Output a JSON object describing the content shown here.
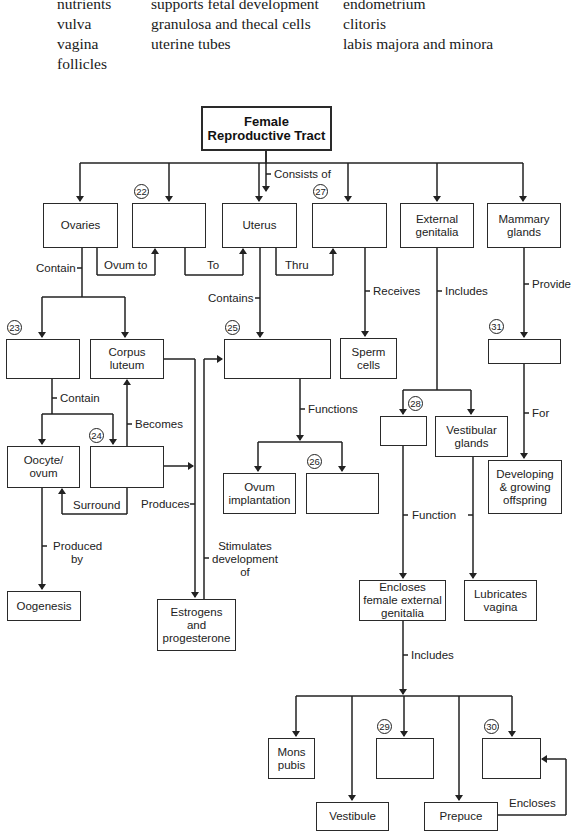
{
  "word_bank": {
    "columns": [
      [
        "nutrients",
        "vulva",
        "vagina",
        "follicles"
      ],
      [
        "supports fetal development",
        "granulosa and thecal cells",
        "uterine tubes"
      ],
      [
        "endometrium",
        "clitoris",
        "labis majora and minora"
      ]
    ]
  },
  "title": "Female Reproductive Tract",
  "boxes": {
    "ovaries": "Ovaries",
    "blank22": "",
    "uterus": "Uterus",
    "blank27": "",
    "external_genitalia": "External genitalia",
    "mammary_glands": "Mammary glands",
    "blank23": "",
    "corpus_luteum": "Corpus luteum",
    "blank25": "",
    "sperm_cells": "Sperm cells",
    "blank31": "",
    "blank28": "",
    "vestibular_glands": "Vestibular glands",
    "oocyte_ovum": "Oocyte/ ovum",
    "blank24": "",
    "ovum_implantation": "Ovum implantation",
    "blank26": "",
    "developing_offspring": "Developing & growing offspring",
    "oogenesis": "Oogenesis",
    "estrogens_progesterone": "Estrogens and progesterone",
    "encloses_female": "Encloses female external genitalia",
    "lubricates_vagina": "Lubricates vagina",
    "mons_pubis": "Mons pubis",
    "blank29": "",
    "blank30": "",
    "vestibule": "Vestibule",
    "prepuce": "Prepuce"
  },
  "numbers": {
    "n22": "22",
    "n23": "23",
    "n24": "24",
    "n25": "25",
    "n26": "26",
    "n27": "27",
    "n28": "28",
    "n29": "29",
    "n30": "30",
    "n31": "31"
  },
  "links": {
    "consists_of": "Consists of",
    "ovum_to": "Ovum to",
    "to": "To",
    "thru": "Thru",
    "contain_ovaries": "Contain",
    "contains_uterus": "Contains",
    "receives": "Receives",
    "includes_ext": "Includes",
    "provide": "Provide",
    "contain_23": "Contain",
    "becomes": "Becomes",
    "functions": "Functions",
    "for": "For",
    "surround": "Surround",
    "produces": "Produces",
    "produced_by": "Produced by",
    "stimulates": "Stimulates development of",
    "function": "Function",
    "includes_bottom": "Includes",
    "encloses": "Encloses"
  }
}
